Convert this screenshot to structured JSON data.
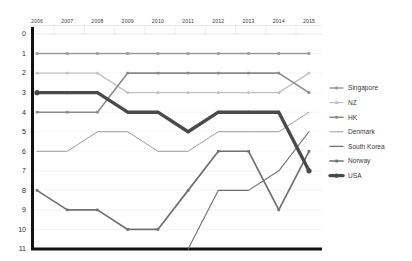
{
  "chart_data": {
    "type": "line",
    "title": "",
    "subtitle": "",
    "xlabel": "",
    "ylabel": "",
    "categories": [
      "2006",
      "2007",
      "2008",
      "2009",
      "2010",
      "2011",
      "2012",
      "2013",
      "2014",
      "2015"
    ],
    "x": [
      2006,
      2007,
      2008,
      2009,
      2010,
      2011,
      2012,
      2013,
      2014,
      2015
    ],
    "y_ticks": [
      "0",
      "1",
      "2",
      "3",
      "4",
      "5",
      "6",
      "7",
      "8",
      "9",
      "10",
      "11"
    ],
    "ylim": [
      0,
      11
    ],
    "y_inverted": true,
    "grid": true,
    "legend_position": "right",
    "series": [
      {
        "name": "Singapore",
        "color": "#9a9a9a",
        "width": 1.4,
        "markers": true,
        "values": [
          1,
          1,
          1,
          1,
          1,
          1,
          1,
          1,
          1,
          1
        ]
      },
      {
        "name": "NZ",
        "color": "#c2c2c2",
        "width": 1.4,
        "markers": true,
        "values": [
          2,
          2,
          2,
          3,
          3,
          3,
          3,
          3,
          3,
          2
        ]
      },
      {
        "name": "HK",
        "color": "#8a8a8a",
        "width": 1.6,
        "markers": true,
        "values": [
          4,
          4,
          4,
          2,
          2,
          2,
          2,
          2,
          2,
          3
        ]
      },
      {
        "name": "Denmark",
        "color": "#8f8f8f",
        "width": 0.9,
        "markers": false,
        "values": [
          6,
          6,
          5,
          5,
          6,
          6,
          5,
          5,
          5,
          4
        ]
      },
      {
        "name": "South Korea",
        "color": "#6e6e6e",
        "width": 1.1,
        "markers": false,
        "values": [
          null,
          null,
          null,
          null,
          null,
          11,
          8,
          8,
          7,
          5
        ]
      },
      {
        "name": "Norway",
        "color": "#707070",
        "width": 1.7,
        "markers": true,
        "values": [
          8,
          9,
          9,
          10,
          10,
          8,
          6,
          6,
          9,
          6
        ]
      },
      {
        "name": "USA",
        "color": "#4a4a4a",
        "width": 3.4,
        "markers": true,
        "marker_ends_only": true,
        "values": [
          3,
          3,
          3,
          4,
          4,
          5,
          4,
          4,
          4,
          7
        ]
      }
    ]
  },
  "legend": {
    "items": [
      {
        "label": "Singapore"
      },
      {
        "label": "NZ"
      },
      {
        "label": "HK"
      },
      {
        "label": "Denmark"
      },
      {
        "label": "South Korea"
      },
      {
        "label": "Norway"
      },
      {
        "label": "USA"
      }
    ]
  },
  "axes": {
    "y_labels": [
      "0",
      "1",
      "2",
      "3",
      "4",
      "5",
      "6",
      "7",
      "8",
      "9",
      "10",
      "11"
    ],
    "x_labels": [
      "2006",
      "2007",
      "2008",
      "2009",
      "2010",
      "2011",
      "2012",
      "2013",
      "2014",
      "2015"
    ]
  },
  "colors": {
    "axis": "#111111",
    "grid": "#ececec",
    "text": "#3a3a3a",
    "background": "#ffffff"
  }
}
